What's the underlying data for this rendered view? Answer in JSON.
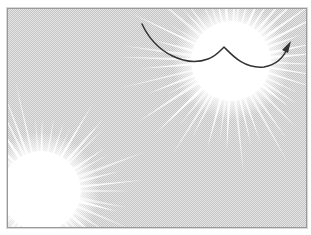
{
  "diagram": {
    "background": {
      "pattern": "dither",
      "base_color": "#e4e4e4",
      "dot_color": "#c8c8c8",
      "bursts": [
        {
          "name": "upper-right-burst",
          "cx": 223,
          "cy": 52,
          "r": 95,
          "rays": 48
        },
        {
          "name": "lower-left-burst",
          "cx": 33,
          "cy": 182,
          "r": 95,
          "rays": 48
        }
      ]
    },
    "curve": {
      "color": "#333333",
      "stroke_width": 1.5,
      "path": "M134 15 C 148 45, 178 58, 200 50 C 208 47, 212 42, 216 38 C 224 46, 236 60, 256 58 C 268 56, 276 48, 280 38",
      "arrow_head": "M283 32 L 274 41 L 280 44 Z"
    },
    "frame": {
      "border_color": "#9a9a9a"
    }
  }
}
